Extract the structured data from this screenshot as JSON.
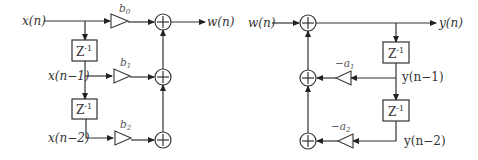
{
  "left_diagram": {
    "title": "FIR section (feedforward)",
    "input_label": "x(n)",
    "output_label": "w(n)",
    "delay_labels": [
      "z-1",
      "z-1"
    ],
    "tap_labels": [
      "x(n−1)",
      "x(n−2)"
    ],
    "gains": [
      "b0",
      "b1",
      "b2"
    ],
    "gain_display": [
      {
        "base": "b",
        "sub": "0"
      },
      {
        "base": "b",
        "sub": "1"
      },
      {
        "base": "b",
        "sub": "2"
      }
    ]
  },
  "right_diagram": {
    "title": "IIR section (feedback)",
    "input_label": "w(n)",
    "output_label": "y(n)",
    "delay_labels": [
      "z-1",
      "z-1"
    ],
    "tap_labels": [
      "y(n−1)",
      "y(n−2)"
    ],
    "gains": [
      "-a1",
      "-a2"
    ],
    "gain_display": [
      {
        "base": "−a",
        "sub": "1"
      },
      {
        "base": "−a",
        "sub": "2"
      }
    ]
  },
  "symbols": {
    "delay": "Z",
    "delay_exp": "-1",
    "adder": "+"
  },
  "colors": {
    "stroke": "#333333",
    "background": "#ffffff"
  }
}
